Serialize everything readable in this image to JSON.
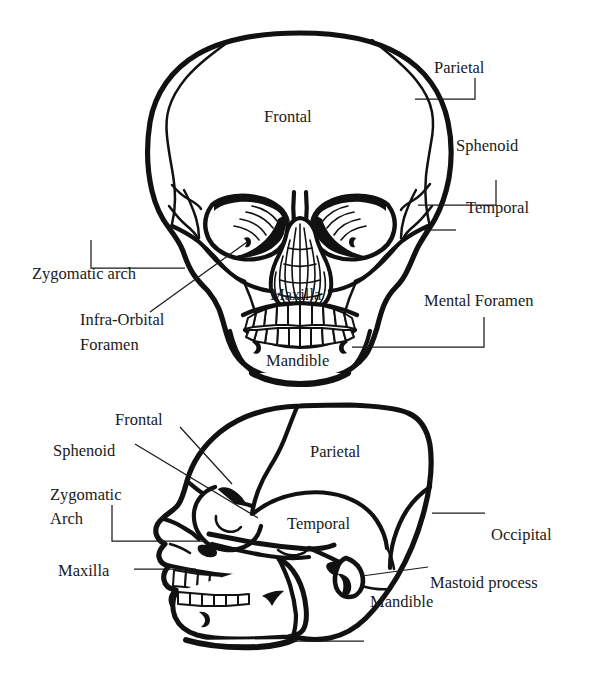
{
  "figure": {
    "background_color": "#ffffff",
    "ink_color": "#111111",
    "views": [
      {
        "id": "anterior",
        "name": "Anterior (frontal) view of skull"
      },
      {
        "id": "lateral",
        "name": "Lateral (side) view of skull"
      }
    ]
  },
  "anterior_view": {
    "name": "anterior-skull-view",
    "labels": {
      "parietal": "Parietal",
      "sphenoid": "Sphenoid",
      "temporal": "Temporal",
      "frontal": "Frontal",
      "zygomatic_arch": "Zygomatic arch",
      "infra_orbital_foramen_line1": "Infra-Orbital",
      "infra_orbital_foramen_line2": "Foramen",
      "maxilla": "Maxilla",
      "mandible": "Mandible",
      "mental_foramen": "Mental Foramen"
    }
  },
  "lateral_view": {
    "name": "lateral-skull-view",
    "labels": {
      "frontal": "Frontal",
      "sphenoid": "Sphenoid",
      "zygomatic_line1": "Zygomatic",
      "zygomatic_line2": "Arch",
      "maxilla": "Maxilla",
      "parietal": "Parietal",
      "temporal": "Temporal",
      "occipital": "Occipital",
      "mastoid_process": "Mastoid process",
      "mandible": "Mandible"
    }
  }
}
